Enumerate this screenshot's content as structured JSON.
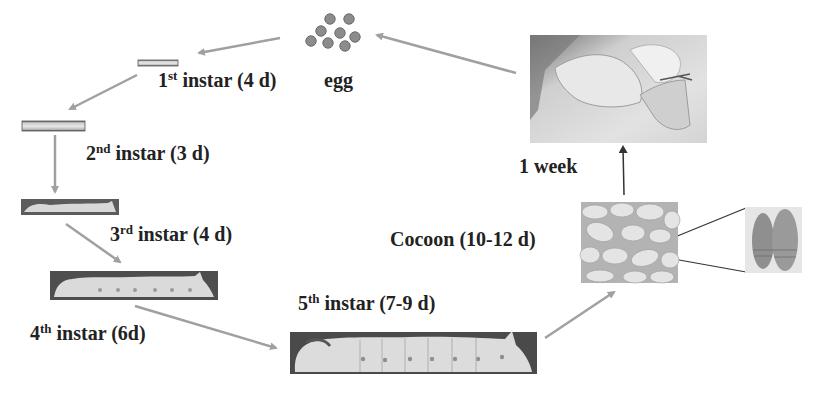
{
  "stages": [
    {
      "id": "egg",
      "label": "egg"
    },
    {
      "id": "instar-1",
      "number": "1",
      "suffix": "st",
      "text": " instar (4 d)"
    },
    {
      "id": "instar-2",
      "number": "2",
      "suffix": "nd",
      "text": " instar (3 d)"
    },
    {
      "id": "instar-3",
      "number": "3",
      "suffix": "rd",
      "text": " instar (4 d)"
    },
    {
      "id": "instar-4",
      "number": "4",
      "suffix": "th",
      "text": " instar (6d)"
    },
    {
      "id": "instar-5",
      "number": "5",
      "suffix": "th",
      "text": " instar (7-9 d)"
    },
    {
      "id": "cocoon",
      "label": "Cocoon (10-12 d)"
    },
    {
      "id": "moth",
      "label": "1 week"
    }
  ],
  "images": {
    "eggs": "egg-cluster",
    "larva_1": "first-instar-larva-photo",
    "larva_2": "second-instar-larva-photo",
    "larva_3": "third-instar-larva-photo",
    "larva_4": "fourth-instar-larva-photo",
    "larva_5": "fifth-instar-larva-photo",
    "cocoon": "cocoon-cluster-photo",
    "pupae": "pupae-detail-photo",
    "moth": "adult-moth-photo"
  },
  "colors": {
    "arrow": "#a0a0a0",
    "arrow_dark": "#333333",
    "egg_fill": "#8c8c8c",
    "egg_stroke": "#6a6a6a",
    "text": "#222222"
  }
}
